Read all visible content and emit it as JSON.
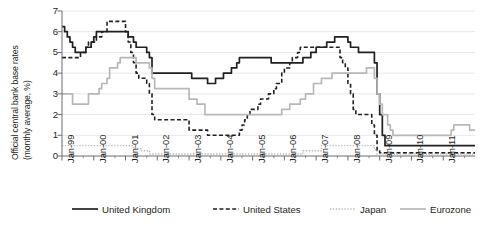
{
  "chart_data": {
    "type": "line",
    "title": "",
    "xlabel": "",
    "ylabel": "Official central bank base rates (monthly average, %)",
    "ylabel_line1": "Official central bank base rates",
    "ylabel_line2": "(monthly average, %)",
    "ylim": [
      0,
      7
    ],
    "yticks": [
      0,
      1,
      2,
      3,
      4,
      5,
      6,
      7
    ],
    "ytick_labels": [
      "0",
      "1",
      "2",
      "3",
      "4",
      "5",
      "6",
      "7"
    ],
    "grid": true,
    "grid_axis": "y",
    "legend_position": "bottom",
    "x_start": "Jan-99",
    "x_end": "Dec-11",
    "xtick_labels": [
      "Jan-99",
      "Jan-00",
      "Jan-01",
      "Jan-02",
      "Jan-03",
      "Jan-04",
      "Jan-05",
      "Jan-06",
      "Jan-07",
      "Jan-08",
      "Jan-09",
      "Jan-10",
      "Jan-11"
    ],
    "xtick_values": [
      1999,
      2000,
      2001,
      2002,
      2003,
      2004,
      2005,
      2006,
      2007,
      2008,
      2009,
      2010,
      2011
    ],
    "x_minor_ticks_per_year": 2,
    "series": [
      {
        "name": "United Kingdom",
        "color": "#231f20",
        "style": "solid",
        "width": 1.7,
        "x": [
          1999.0,
          1999.083,
          1999.167,
          1999.25,
          1999.333,
          1999.417,
          1999.5,
          1999.583,
          1999.667,
          1999.75,
          1999.833,
          1999.917,
          2000.0,
          2000.083,
          2000.167,
          2000.25,
          2000.333,
          2000.417,
          2000.5,
          2000.583,
          2000.667,
          2000.75,
          2000.833,
          2000.917,
          2001.0,
          2001.083,
          2001.167,
          2001.25,
          2001.333,
          2001.5,
          2001.667,
          2001.75,
          2001.833,
          2001.917,
          2002.0,
          2002.5,
          2002.917,
          2003.0,
          2003.083,
          2003.167,
          2003.25,
          2003.5,
          2003.583,
          2003.75,
          2003.833,
          2003.917,
          2004.0,
          2004.083,
          2004.25,
          2004.333,
          2004.417,
          2004.5,
          2004.583,
          2005.0,
          2005.5,
          2005.583,
          2005.667,
          2006.0,
          2006.583,
          2006.75,
          2006.833,
          2007.0,
          2007.083,
          2007.25,
          2007.333,
          2007.5,
          2007.583,
          2007.75,
          2008.0,
          2008.083,
          2008.25,
          2008.333,
          2008.5,
          2008.75,
          2008.833,
          2008.917,
          2009.0,
          2009.083,
          2009.167,
          2009.25,
          2009.333,
          2009.5,
          2010.0,
          2010.5,
          2011.0,
          2011.5,
          2011.99
        ],
        "values": [
          6.25,
          6.0,
          5.75,
          5.5,
          5.25,
          5.0,
          5.0,
          5.0,
          5.0,
          5.25,
          5.25,
          5.5,
          5.75,
          6.0,
          6.0,
          6.0,
          6.0,
          6.0,
          6.0,
          6.0,
          6.0,
          6.0,
          6.0,
          6.0,
          6.0,
          5.75,
          5.75,
          5.5,
          5.25,
          5.25,
          5.0,
          4.75,
          4.0,
          4.0,
          4.0,
          4.0,
          4.0,
          4.0,
          3.75,
          3.75,
          3.75,
          3.75,
          3.5,
          3.5,
          3.75,
          3.75,
          3.75,
          4.0,
          4.0,
          4.25,
          4.25,
          4.5,
          4.75,
          4.75,
          4.75,
          4.5,
          4.5,
          4.5,
          4.75,
          4.75,
          5.0,
          5.25,
          5.25,
          5.25,
          5.5,
          5.5,
          5.75,
          5.75,
          5.5,
          5.25,
          5.25,
          5.0,
          5.0,
          5.0,
          4.5,
          3.0,
          2.0,
          1.0,
          0.5,
          0.5,
          0.5,
          0.5,
          0.5,
          0.5,
          0.5,
          0.5,
          0.5
        ]
      },
      {
        "name": "United States",
        "color": "#231f20",
        "style": "dashed",
        "width": 1.6,
        "x": [
          1999.0,
          1999.25,
          1999.5,
          1999.583,
          1999.75,
          1999.833,
          1999.917,
          2000.0,
          2000.083,
          2000.25,
          2000.417,
          2000.5,
          2000.667,
          2000.917,
          2001.0,
          2001.083,
          2001.167,
          2001.25,
          2001.333,
          2001.417,
          2001.5,
          2001.667,
          2001.75,
          2001.833,
          2001.917,
          2002.0,
          2002.917,
          2003.0,
          2003.5,
          2003.583,
          2004.0,
          2004.5,
          2004.583,
          2004.667,
          2004.75,
          2004.833,
          2004.917,
          2005.0,
          2005.167,
          2005.25,
          2005.417,
          2005.5,
          2005.667,
          2005.75,
          2005.917,
          2006.0,
          2006.167,
          2006.25,
          2006.417,
          2006.5,
          2007.0,
          2007.5,
          2007.75,
          2007.833,
          2007.917,
          2008.0,
          2008.083,
          2008.167,
          2008.25,
          2008.333,
          2008.75,
          2008.833,
          2008.917,
          2009.0,
          2009.083,
          2010.0,
          2010.5,
          2011.0,
          2011.5,
          2011.99
        ],
        "values": [
          4.75,
          4.75,
          4.75,
          5.0,
          5.25,
          5.5,
          5.5,
          5.5,
          5.75,
          6.0,
          6.5,
          6.5,
          6.5,
          6.5,
          6.0,
          5.5,
          5.0,
          4.5,
          4.0,
          3.75,
          3.75,
          3.5,
          3.0,
          2.0,
          1.75,
          1.75,
          1.75,
          1.25,
          1.25,
          1.0,
          1.0,
          1.0,
          1.25,
          1.5,
          1.75,
          2.0,
          2.25,
          2.25,
          2.5,
          2.75,
          2.75,
          3.0,
          3.25,
          3.5,
          4.0,
          4.25,
          4.5,
          4.75,
          5.0,
          5.25,
          5.25,
          5.25,
          4.75,
          4.5,
          4.25,
          3.5,
          3.0,
          2.25,
          2.0,
          2.0,
          1.5,
          1.0,
          0.25,
          0.15,
          0.15,
          0.15,
          0.15,
          0.15,
          0.15,
          0.15
        ]
      },
      {
        "name": "Japan",
        "color": "#b8b8b8",
        "style": "dotted",
        "width": 1.4,
        "x": [
          1999.0,
          2001.0,
          2001.25,
          2001.5,
          2001.75,
          2002.0,
          2003.0,
          2004.0,
          2005.0,
          2006.0,
          2006.5,
          2006.583,
          2006.75,
          2007.0,
          2007.167,
          2007.25,
          2008.0,
          2008.75,
          2008.833,
          2008.917,
          2009.0,
          2010.0,
          2011.0,
          2011.99
        ],
        "values": [
          0.5,
          0.5,
          0.35,
          0.25,
          0.1,
          0.1,
          0.1,
          0.1,
          0.1,
          0.1,
          0.1,
          0.25,
          0.25,
          0.25,
          0.5,
          0.5,
          0.5,
          0.5,
          0.3,
          0.1,
          0.1,
          0.1,
          0.1,
          0.1
        ]
      },
      {
        "name": "Eurozone",
        "color": "#b8b8b8",
        "style": "solid",
        "width": 1.7,
        "x": [
          1999.0,
          1999.25,
          1999.333,
          1999.75,
          1999.833,
          2000.0,
          2000.167,
          2000.25,
          2000.417,
          2000.5,
          2000.667,
          2000.75,
          2000.833,
          2001.0,
          2001.25,
          2001.333,
          2001.667,
          2001.75,
          2001.833,
          2001.917,
          2002.0,
          2002.917,
          2003.0,
          2003.167,
          2003.25,
          2003.417,
          2003.5,
          2004.0,
          2005.0,
          2005.917,
          2006.0,
          2006.167,
          2006.25,
          2006.5,
          2006.667,
          2006.917,
          2007.0,
          2007.167,
          2007.25,
          2007.5,
          2007.583,
          2008.0,
          2008.5,
          2008.583,
          2008.75,
          2008.833,
          2008.917,
          2009.0,
          2009.083,
          2009.25,
          2009.333,
          2009.417,
          2009.5,
          2010.0,
          2010.5,
          2011.0,
          2011.25,
          2011.333,
          2011.5,
          2011.667,
          2011.833,
          2011.99
        ],
        "values": [
          3.0,
          3.0,
          2.5,
          2.5,
          3.0,
          3.0,
          3.25,
          3.5,
          3.75,
          4.25,
          4.25,
          4.5,
          4.75,
          4.75,
          4.75,
          4.5,
          4.5,
          4.25,
          3.75,
          3.25,
          3.25,
          3.25,
          2.75,
          2.75,
          2.5,
          2.5,
          2.0,
          2.0,
          2.0,
          2.25,
          2.25,
          2.5,
          2.5,
          2.75,
          3.0,
          3.5,
          3.5,
          3.75,
          3.75,
          4.0,
          4.0,
          4.0,
          4.0,
          4.25,
          4.25,
          3.75,
          3.0,
          2.5,
          2.0,
          1.5,
          1.25,
          1.0,
          1.0,
          1.0,
          1.0,
          1.0,
          1.25,
          1.5,
          1.5,
          1.5,
          1.25,
          1.25
        ]
      }
    ]
  },
  "legend": {
    "items": [
      {
        "label": "United Kingdom",
        "color": "#231f20",
        "style": "solid"
      },
      {
        "label": "United States",
        "color": "#231f20",
        "style": "dashed"
      },
      {
        "label": "Japan",
        "color": "#b8b8b8",
        "style": "dotted"
      },
      {
        "label": "Eurozone",
        "color": "#b8b8b8",
        "style": "solid"
      }
    ]
  },
  "colors": {
    "axis": "#6d6e71",
    "grid": "#e8e8e8",
    "text": "#231f20",
    "dark_series": "#231f20",
    "light_series": "#b8b8b8"
  }
}
